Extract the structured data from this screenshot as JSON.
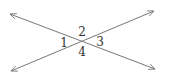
{
  "diagram": {
    "type": "intersecting-lines",
    "line_color": "#777777",
    "label_color": "#333333",
    "lines": [
      {
        "name": "line-a",
        "from": [
          10,
          14
        ],
        "to": [
          155,
          69
        ],
        "arrows": "both"
      },
      {
        "name": "line-b",
        "from": [
          11,
          71
        ],
        "to": [
          154,
          11
        ],
        "arrows": "both"
      }
    ],
    "intersection": [
      82,
      41
    ],
    "angles": [
      {
        "label": "1",
        "x": 64,
        "y": 47
      },
      {
        "label": "2",
        "x": 82,
        "y": 36
      },
      {
        "label": "3",
        "x": 100,
        "y": 46
      },
      {
        "label": "4",
        "x": 82,
        "y": 56
      }
    ]
  }
}
